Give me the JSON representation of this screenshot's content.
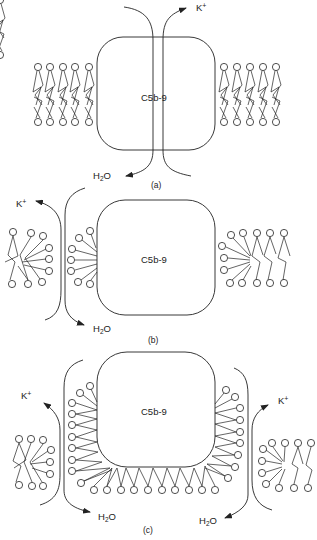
{
  "figure": {
    "panels": [
      {
        "id": "a",
        "caption": "(a)",
        "complex_label": "C5b-9",
        "ion_label": "K+",
        "water_label": "H2O",
        "description": "C5b-9 complex spanning intact lipid bilayer with central transmembrane channel"
      },
      {
        "id": "b",
        "caption": "(b)",
        "complex_label": "C5b-9",
        "ion_label": "K+",
        "water_label": "H2O",
        "description": "Lipids reorienting around C5b-9 on left side, leak pathway forming"
      },
      {
        "id": "c",
        "caption": "(c)",
        "complex_label": "C5b-9",
        "ion_labels": [
          "K+",
          "K+"
        ],
        "water_labels": [
          "H2O",
          "H2O"
        ],
        "description": "C5b-9 surrounded by lipid micelle-like layer, leak pathways on both sides"
      }
    ],
    "colors": {
      "line": "#222222",
      "background": "#ffffff"
    }
  }
}
